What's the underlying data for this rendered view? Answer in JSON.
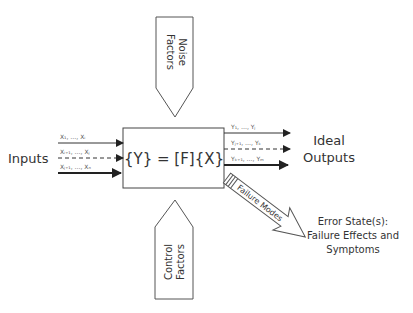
{
  "diagram": {
    "type": "p-diagram",
    "system_box": {
      "equation": "{Y} = [F]{X}"
    },
    "inputs": {
      "label": "Inputs",
      "lines": [
        {
          "label": "X₁, …, Xᵢ",
          "style": "solid"
        },
        {
          "label": "Xᵢ₊₁, …, Xⱼ",
          "style": "dashed"
        },
        {
          "label": "Xⱼ₊₁, …, Xₙ",
          "style": "thick"
        }
      ]
    },
    "outputs": {
      "label_line1": "Ideal",
      "label_line2": "Outputs",
      "lines": [
        {
          "label": "Y₁, …, Yⱼ",
          "style": "solid"
        },
        {
          "label": "Yⱼ₊₁, …, Yₖ",
          "style": "dashed"
        },
        {
          "label": "Yₖ₊₁, …, Yₘ",
          "style": "thick"
        }
      ]
    },
    "noise_factors": {
      "line1": "Noise",
      "line2": "Factors"
    },
    "control_factors": {
      "line1": "Control",
      "line2": "Factors"
    },
    "failure_modes": {
      "label": "Failure Modes"
    },
    "error_state": {
      "line1": "Error State(s):",
      "line2": "Failure Effects and",
      "line3": "Symptoms"
    },
    "colors": {
      "stroke": "#333333",
      "text": "#333333",
      "background": "#ffffff"
    }
  }
}
